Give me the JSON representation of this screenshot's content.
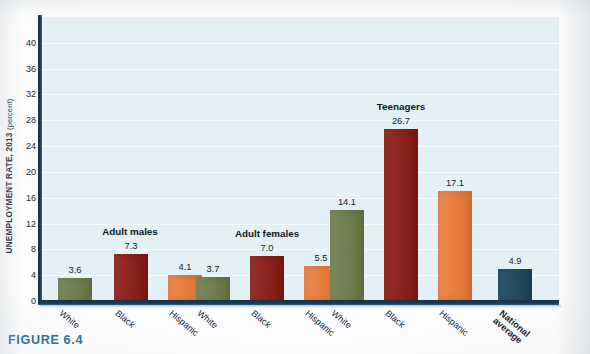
{
  "figure": {
    "caption": "FIGURE 6.4",
    "y_axis_title": "UNEMPLOYMENT RATE, 2013",
    "y_axis_unit": "(percent)"
  },
  "colors": {
    "white_bar": "#6f7f4a",
    "black_bar": "#8d1a12",
    "hispanic_bar": "#f07a35",
    "national_bar": "#1c4a63",
    "plot_background": "#e3f0f6",
    "axis": "#17354c",
    "caption": "#1f6fa8"
  },
  "chart_data": {
    "type": "bar",
    "title": "",
    "xlabel": "",
    "ylabel": "UNEMPLOYMENT RATE, 2013 (percent)",
    "ylim": [
      0,
      44
    ],
    "yticks": [
      0,
      4,
      8,
      12,
      16,
      20,
      24,
      28,
      32,
      36,
      40
    ],
    "grid": true,
    "legend": "none",
    "group_labels": [
      "Adult males",
      "Adult females",
      "Teenagers",
      ""
    ],
    "categories": [
      "White",
      "Black",
      "Hispanic"
    ],
    "groups": [
      {
        "label": "Adult males",
        "bars": [
          {
            "category": "White",
            "value": 3.6,
            "value_label": "3.6",
            "color_key": "white"
          },
          {
            "category": "Black",
            "value": 7.3,
            "value_label": "7.3",
            "color_key": "black"
          },
          {
            "category": "Hispanic",
            "value": 4.1,
            "value_label": "4.1",
            "color_key": "hisp"
          }
        ]
      },
      {
        "label": "Adult females",
        "bars": [
          {
            "category": "White",
            "value": 3.7,
            "value_label": "3.7",
            "color_key": "white"
          },
          {
            "category": "Black",
            "value": 7.0,
            "value_label": "7.0",
            "color_key": "black"
          },
          {
            "category": "Hispanic",
            "value": 5.5,
            "value_label": "5.5",
            "color_key": "hisp"
          }
        ]
      },
      {
        "label": "Teenagers",
        "bars": [
          {
            "category": "White",
            "value": 14.1,
            "value_label": "14.1",
            "color_key": "white"
          },
          {
            "category": "Black",
            "value": 26.7,
            "value_label": "26.7",
            "color_key": "black"
          },
          {
            "category": "Hispanic",
            "value": 17.1,
            "value_label": "17.1",
            "color_key": "hisp"
          }
        ]
      },
      {
        "label": "",
        "bars": [
          {
            "category": "National average",
            "value": 4.9,
            "value_label": "4.9",
            "color_key": "natl"
          }
        ]
      }
    ],
    "x_tick_labels": [
      "White",
      "Black",
      "Hispanic",
      "White",
      "Black",
      "Hispanic",
      "White",
      "Black",
      "Hispanic",
      "National average"
    ]
  }
}
